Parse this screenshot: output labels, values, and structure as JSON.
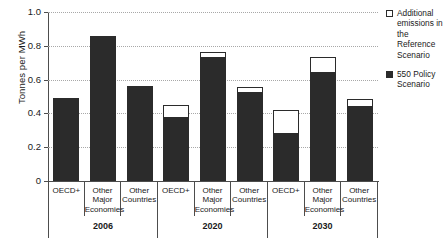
{
  "chart_data": {
    "type": "bar",
    "subtype": "stacked",
    "title": "",
    "xlabel": "",
    "ylabel": "Tonnes per MWh",
    "ylim": [
      0,
      1.0
    ],
    "yticks": [
      "0",
      "0.2",
      "0.4",
      "0.6",
      "0.8",
      "1.0"
    ],
    "ytick_values": [
      0,
      0.2,
      0.4,
      0.6,
      0.8,
      1.0
    ],
    "grid": true,
    "legend_position": "right",
    "legend": [
      {
        "label": "Additional emissions in the Reference Scenario",
        "color": "#ffffff",
        "style": "outline"
      },
      {
        "label": "550 Policy Scenario",
        "color": "#2b2b2b",
        "style": "filled"
      }
    ],
    "periods": [
      {
        "label": "2006",
        "categories": [
          "OECD+",
          "Other Major Economies",
          "Other Countries"
        ]
      },
      {
        "label": "2020",
        "categories": [
          "OECD+",
          "Other Major Economies",
          "Other Countries"
        ]
      },
      {
        "label": "2030",
        "categories": [
          "OECD+",
          "Other Major Economies",
          "Other Countries"
        ]
      }
    ],
    "categories": [
      "OECD+",
      "Other Major Economies",
      "Other Countries",
      "OECD+",
      "Other Major Economies",
      "Other Countries",
      "OECD+",
      "Other Major Economies",
      "Other Countries"
    ],
    "series": [
      {
        "name": "550 Policy Scenario",
        "values": [
          0.49,
          0.86,
          0.565,
          0.37,
          0.725,
          0.52,
          0.28,
          0.64,
          0.44
        ]
      },
      {
        "name": "Additional emissions in the Reference Scenario",
        "values": [
          0,
          0,
          0,
          0.08,
          0.04,
          0.035,
          0.14,
          0.095,
          0.045
        ]
      }
    ],
    "totals": [
      0.49,
      0.86,
      0.565,
      0.45,
      0.765,
      0.555,
      0.42,
      0.735,
      0.485
    ],
    "bars": [
      {
        "period": "2006",
        "category": "OECD+",
        "policy": 0.49,
        "additional": 0,
        "total": 0.49
      },
      {
        "period": "2006",
        "category": "Other Major Economies",
        "policy": 0.86,
        "additional": 0,
        "total": 0.86
      },
      {
        "period": "2006",
        "category": "Other Countries",
        "policy": 0.565,
        "additional": 0,
        "total": 0.565
      },
      {
        "period": "2020",
        "category": "OECD+",
        "policy": 0.37,
        "additional": 0.08,
        "total": 0.45
      },
      {
        "period": "2020",
        "category": "Other Major Economies",
        "policy": 0.725,
        "additional": 0.04,
        "total": 0.765
      },
      {
        "period": "2020",
        "category": "Other Countries",
        "policy": 0.52,
        "additional": 0.035,
        "total": 0.555
      },
      {
        "period": "2030",
        "category": "OECD+",
        "policy": 0.28,
        "additional": 0.14,
        "total": 0.42
      },
      {
        "period": "2030",
        "category": "Other Major Economies",
        "policy": 0.64,
        "additional": 0.095,
        "total": 0.735
      },
      {
        "period": "2030",
        "category": "Other Countries",
        "policy": 0.44,
        "additional": 0.045,
        "total": 0.485
      }
    ],
    "colors": {
      "policy": "#2b2b2b",
      "additional": "#ffffff",
      "axis": "#4d4d4d",
      "grid": "#a8a8a8",
      "text": "#1a1a1a"
    }
  }
}
